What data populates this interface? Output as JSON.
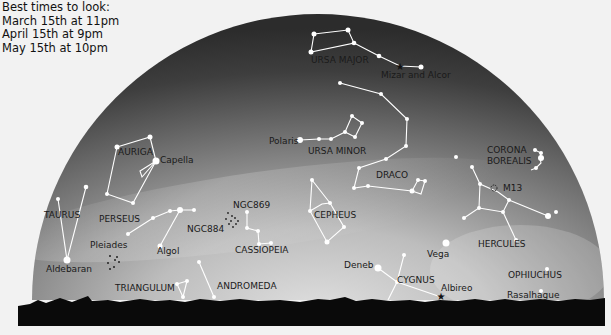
{
  "title_block": {
    "heading": "Best times to look:",
    "times": [
      "March 15th at 11pm",
      "April 15th at 9pm",
      "May 15th at 10pm"
    ]
  },
  "colors": {
    "page_bg": "#f2f2f2",
    "sky_dark": "#3a3a3a",
    "sky_light": "#d4d4d4",
    "horizon": "#0a0a0a",
    "star": "#ffffff",
    "label": "#1a1a1a"
  },
  "constellations": [
    {
      "name": "URSA MAJOR",
      "label_xy": [
        311,
        63
      ]
    },
    {
      "name": "URSA MINOR",
      "label_xy": [
        308,
        154
      ]
    },
    {
      "name": "AURIGA",
      "label_xy": [
        118,
        155
      ]
    },
    {
      "name": "DRACO",
      "label_xy": [
        376,
        178
      ]
    },
    {
      "name": "CORONA BOREALIS",
      "label_xy": [
        487,
        153
      ]
    },
    {
      "name": "TAURUS",
      "label_xy": [
        44,
        218
      ]
    },
    {
      "name": "PERSEUS",
      "label_xy": [
        99,
        222
      ]
    },
    {
      "name": "CEPHEUS",
      "label_xy": [
        314,
        218
      ]
    },
    {
      "name": "CASSIOPEIA",
      "label_xy": [
        235,
        253
      ]
    },
    {
      "name": "HERCULES",
      "label_xy": [
        478,
        247
      ]
    },
    {
      "name": "CYGNUS",
      "label_xy": [
        397,
        283
      ]
    },
    {
      "name": "OPHIUCHUS",
      "label_xy": [
        508,
        278
      ]
    },
    {
      "name": "TRIANGULUM",
      "label_xy": [
        115,
        291
      ]
    },
    {
      "name": "ANDROMEDA",
      "label_xy": [
        217,
        289
      ]
    }
  ],
  "named_objects": [
    {
      "name": "Mizar and Alcor",
      "label_xy": [
        381,
        78
      ]
    },
    {
      "name": "Polaris",
      "label_xy": [
        269,
        144
      ]
    },
    {
      "name": "Capella",
      "label_xy": [
        160,
        163
      ]
    },
    {
      "name": "M13",
      "label_xy": [
        503,
        191
      ]
    },
    {
      "name": "NGC869",
      "label_xy": [
        233,
        208
      ]
    },
    {
      "name": "NGC884",
      "label_xy": [
        187,
        232
      ]
    },
    {
      "name": "Pleiades",
      "label_xy": [
        90,
        248
      ]
    },
    {
      "name": "Algol",
      "label_xy": [
        157,
        254
      ]
    },
    {
      "name": "Aldebaran",
      "label_xy": [
        46,
        272
      ]
    },
    {
      "name": "Vega",
      "label_xy": [
        427,
        257
      ]
    },
    {
      "name": "Deneb",
      "label_xy": [
        344,
        268
      ]
    },
    {
      "name": "Albireo",
      "label_xy": [
        441,
        291
      ]
    },
    {
      "name": "Rasalhague",
      "label_xy": [
        507,
        298
      ]
    }
  ]
}
